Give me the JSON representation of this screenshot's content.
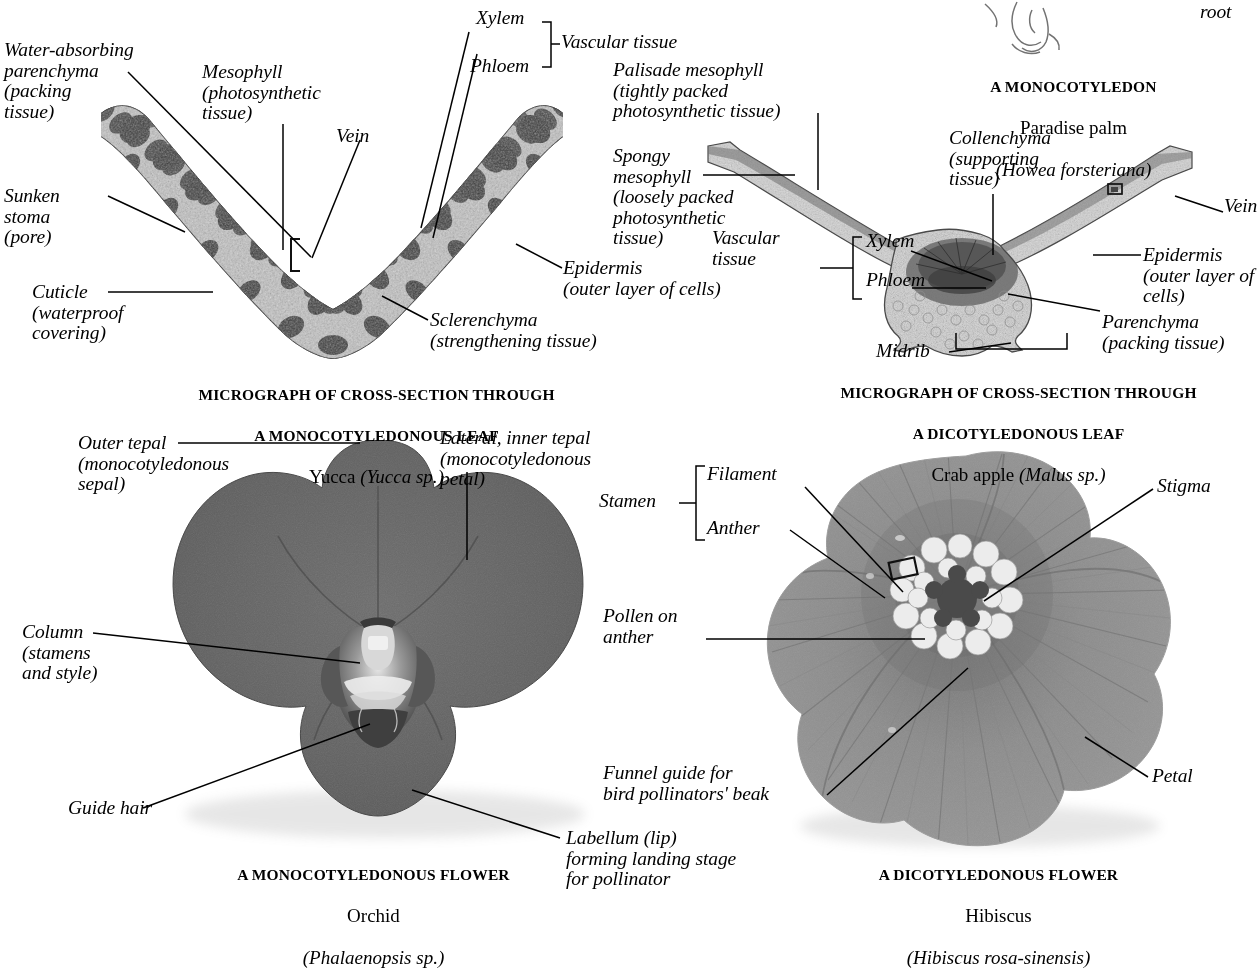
{
  "page": {
    "background": "#ffffff",
    "ink": "#000000"
  },
  "partial_top_label": {
    "text": "root"
  },
  "panels": [
    {
      "id": "monocot-leaf",
      "caption": {
        "line1": "MICROGRAPH OF CROSS-SECTION THROUGH",
        "line2": "A MONOCOTYLEDONOUS LEAF",
        "common_name": "Yucca ",
        "scientific_name": "(Yucca sp.)"
      },
      "labels": [
        {
          "id": "water-absorbing-parenchyma",
          "text": "Water-absorbing\nparenchyma\n(packing\ntissue)"
        },
        {
          "id": "mesophyll",
          "text": "Mesophyll\n(photosynthetic\ntissue)"
        },
        {
          "id": "vein",
          "text": "Vein"
        },
        {
          "id": "xylem",
          "text": "Xylem"
        },
        {
          "id": "phloem",
          "text": "Phloem"
        },
        {
          "id": "vascular-tissue",
          "text": "Vascular tissue"
        },
        {
          "id": "sunken-stoma",
          "text": "Sunken\nstoma\n(pore)"
        },
        {
          "id": "cuticle",
          "text": "Cuticle\n(waterproof\ncovering)"
        },
        {
          "id": "sclerenchyma",
          "text": "Sclerenchyma\n(strengthening tissue)"
        },
        {
          "id": "epidermis",
          "text": "Epidermis\n(outer layer of cells)"
        }
      ]
    },
    {
      "id": "dicot-leaf",
      "caption": {
        "line1": "MICROGRAPH OF CROSS-SECTION THROUGH",
        "line2": "A DICOTYLEDONOUS LEAF",
        "common_name": "Crab apple ",
        "scientific_name": "(Malus sp.)"
      },
      "heading": {
        "line1": "A MONOCOTYLEDON",
        "line2": "Paradise palm",
        "line3": "(Howea forsteriana)"
      },
      "labels": [
        {
          "id": "palisade-mesophyll",
          "text": "Palisade mesophyll\n(tightly packed\nphotosynthetic tissue)"
        },
        {
          "id": "spongy-mesophyll",
          "text": "Spongy\nmesophyll\n(loosely packed\nphotosynthetic\ntissue)"
        },
        {
          "id": "collenchyma",
          "text": "Collenchyma\n(supporting\ntissue)"
        },
        {
          "id": "vein",
          "text": "Vein"
        },
        {
          "id": "vascular-tissue",
          "text": "Vascular\ntissue"
        },
        {
          "id": "xylem",
          "text": "Xylem"
        },
        {
          "id": "phloem",
          "text": "Phloem"
        },
        {
          "id": "epidermis",
          "text": "Epidermis\n(outer layer of\ncells)"
        },
        {
          "id": "parenchyma",
          "text": "Parenchyma\n(packing tissue)"
        },
        {
          "id": "midrib",
          "text": "Midrib"
        }
      ]
    },
    {
      "id": "monocot-flower",
      "caption": {
        "line1": "A MONOCOTYLEDONOUS FLOWER",
        "common_name": "Orchid",
        "scientific_name": "(Phalaenopsis sp.)"
      },
      "labels": [
        {
          "id": "outer-tepal",
          "text": "Outer tepal\n(monocotyledonous\nsepal)"
        },
        {
          "id": "lateral-inner-tepal",
          "text": "Lateral, inner tepal\n(monocotyledonous\npetal)"
        },
        {
          "id": "column",
          "text": "Column\n(stamens\nand style)"
        },
        {
          "id": "guide-hair",
          "text": "Guide hair"
        },
        {
          "id": "labellum",
          "text": "Labellum (lip)\nforming landing stage\nfor pollinator"
        }
      ]
    },
    {
      "id": "dicot-flower",
      "caption": {
        "line1": "A DICOTYLEDONOUS FLOWER",
        "common_name": "Hibiscus",
        "scientific_name": "(Hibiscus rosa-sinensis)"
      },
      "labels": [
        {
          "id": "stamen",
          "text": "Stamen"
        },
        {
          "id": "filament",
          "text": "Filament"
        },
        {
          "id": "anther",
          "text": "Anther"
        },
        {
          "id": "stigma",
          "text": "Stigma"
        },
        {
          "id": "pollen-on-anther",
          "text": "Pollen on\nanther"
        },
        {
          "id": "funnel-guide",
          "text": "Funnel guide for\nbird pollinators' beak"
        },
        {
          "id": "petal",
          "text": "Petal"
        }
      ]
    }
  ]
}
